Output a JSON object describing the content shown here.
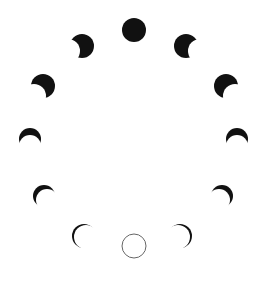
{
  "diagram": {
    "title": "",
    "background": "#ffffff",
    "ink": "#111111",
    "outline": "#666666",
    "phases": [
      {
        "name": "full-moon",
        "cx": 134,
        "cy": 30,
        "r": 12,
        "shadow_dx": 0,
        "shadow_dy": 0,
        "type": "full"
      },
      {
        "name": "waning-gibbous-1",
        "cx": 186,
        "cy": 46,
        "r": 12,
        "shadow_dx": 14,
        "shadow_dy": 5,
        "type": "bite"
      },
      {
        "name": "waning-gibbous-2",
        "cx": 226,
        "cy": 86,
        "r": 12,
        "shadow_dx": 9,
        "shadow_dy": 10,
        "type": "bite"
      },
      {
        "name": "last-quarter-crescent",
        "cx": 237,
        "cy": 139,
        "r": 11,
        "shadow_dx": 0,
        "shadow_dy": 7,
        "type": "bite"
      },
      {
        "name": "waning-crescent-1",
        "cx": 222,
        "cy": 196,
        "r": 11,
        "shadow_dx": -3,
        "shadow_dy": 4,
        "type": "bite"
      },
      {
        "name": "waning-crescent-2",
        "cx": 180,
        "cy": 236,
        "r": 12,
        "shadow_dx": -2,
        "shadow_dy": 1,
        "type": "bite"
      },
      {
        "name": "new-moon",
        "cx": 134,
        "cy": 246,
        "r": 12,
        "shadow_dx": 0,
        "shadow_dy": 0,
        "type": "new"
      },
      {
        "name": "waxing-crescent-1",
        "cx": 84,
        "cy": 236,
        "r": 12,
        "shadow_dx": 2,
        "shadow_dy": 1,
        "type": "bite"
      },
      {
        "name": "waxing-crescent-2",
        "cx": 44,
        "cy": 196,
        "r": 11,
        "shadow_dx": 3,
        "shadow_dy": 4,
        "type": "bite"
      },
      {
        "name": "first-quarter-crescent",
        "cx": 30,
        "cy": 139,
        "r": 11,
        "shadow_dx": 0,
        "shadow_dy": 7,
        "type": "bite"
      },
      {
        "name": "waxing-gibbous-2",
        "cx": 43,
        "cy": 86,
        "r": 12,
        "shadow_dx": -9,
        "shadow_dy": 10,
        "type": "bite"
      },
      {
        "name": "waxing-gibbous-1",
        "cx": 82,
        "cy": 46,
        "r": 12,
        "shadow_dx": -14,
        "shadow_dy": 5,
        "type": "bite"
      }
    ]
  }
}
